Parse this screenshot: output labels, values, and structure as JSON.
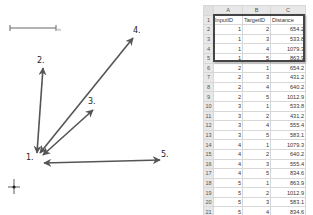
{
  "diagram": {
    "scale_bar": {
      "label": ""
    },
    "nodes": [
      {
        "id": "1",
        "label": "1.",
        "x": 26,
        "y": 154
      },
      {
        "id": "2",
        "label": "2.",
        "x": 37,
        "y": 57
      },
      {
        "id": "3",
        "label": "3.",
        "x": 88,
        "y": 98
      },
      {
        "id": "4",
        "label": "4.",
        "x": 133,
        "y": 27
      },
      {
        "id": "5",
        "label": "5.",
        "x": 161,
        "y": 151
      }
    ],
    "edges": [
      {
        "from": "1",
        "to": "2",
        "bidirectional": true
      },
      {
        "from": "1",
        "to": "3",
        "bidirectional": true
      },
      {
        "from": "1",
        "to": "4",
        "bidirectional": true
      },
      {
        "from": "1",
        "to": "5",
        "bidirectional": true
      }
    ],
    "arrow_color": "#555555"
  },
  "spreadsheet": {
    "column_letters": [
      "A",
      "B",
      "C"
    ],
    "header": {
      "row": "1",
      "cells": [
        "InputID",
        "TargetID",
        "Distance"
      ]
    },
    "rows": [
      {
        "row": "2",
        "cells": [
          "1",
          "2",
          "654.2"
        ]
      },
      {
        "row": "3",
        "cells": [
          "1",
          "3",
          "533.8"
        ]
      },
      {
        "row": "4",
        "cells": [
          "1",
          "4",
          "1079.3"
        ]
      },
      {
        "row": "5",
        "cells": [
          "1",
          "5",
          "863.9"
        ]
      },
      {
        "row": "6",
        "cells": [
          "2",
          "1",
          "654.2"
        ]
      },
      {
        "row": "7",
        "cells": [
          "2",
          "3",
          "431.2"
        ]
      },
      {
        "row": "8",
        "cells": [
          "2",
          "4",
          "640.2"
        ]
      },
      {
        "row": "9",
        "cells": [
          "2",
          "5",
          "1012.9"
        ]
      },
      {
        "row": "10",
        "cells": [
          "3",
          "1",
          "533.8"
        ]
      },
      {
        "row": "11",
        "cells": [
          "3",
          "2",
          "431.2"
        ]
      },
      {
        "row": "12",
        "cells": [
          "3",
          "4",
          "555.4"
        ]
      },
      {
        "row": "13",
        "cells": [
          "3",
          "5",
          "583.1"
        ]
      },
      {
        "row": "14",
        "cells": [
          "4",
          "1",
          "1079.3"
        ]
      },
      {
        "row": "15",
        "cells": [
          "4",
          "2",
          "640.2"
        ]
      },
      {
        "row": "16",
        "cells": [
          "4",
          "3",
          "555.4"
        ]
      },
      {
        "row": "17",
        "cells": [
          "4",
          "5",
          "834.6"
        ]
      },
      {
        "row": "18",
        "cells": [
          "5",
          "1",
          "863.9"
        ]
      },
      {
        "row": "19",
        "cells": [
          "5",
          "2",
          "1012.9"
        ]
      },
      {
        "row": "20",
        "cells": [
          "5",
          "3",
          "583.1"
        ]
      },
      {
        "row": "21",
        "cells": [
          "5",
          "4",
          "834.6"
        ]
      }
    ],
    "selection": {
      "range": "A1:C5",
      "border_color": "#444444"
    }
  }
}
